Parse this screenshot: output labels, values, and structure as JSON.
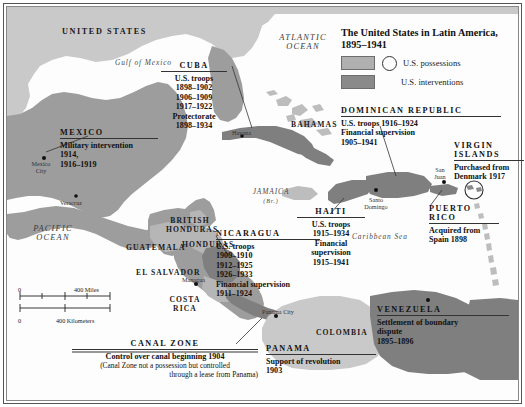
{
  "title": {
    "line1": "The United States in Latin America,",
    "line2": "1895–1941"
  },
  "legend": {
    "possessions": "U.S. possessions",
    "interventions": "U.S. interventions",
    "possessions_color": "#b0b0b0",
    "interventions_color": "#8a8a8a"
  },
  "regions": {
    "united_states": "UNITED STATES",
    "mexico_land": "MEXICO",
    "british_honduras": "BRITISH\nHONDURAS",
    "guatemala": "GUATEMALA",
    "honduras": "HONDURAS",
    "el_salvador": "EL SALVADOR",
    "costa_rica": "COSTA\nRICA",
    "colombia": "COLOMBIA",
    "bahamas": "BAHAMAS",
    "jamaica": "JAMAICA",
    "jamaica_sub": "(Br.)"
  },
  "oceans": {
    "atlantic": "ATLANTIC\nOCEAN",
    "pacific": "PACIFIC\nOCEAN",
    "gulf_of_mexico": "Gulf of Mexico",
    "caribbean_sea": "Caribbean Sea"
  },
  "cities": {
    "mexico_city": "Mexico\nCity",
    "veracruz": "Veracruz",
    "havana": "Havana",
    "managua": "Managua",
    "santo_domingo": "Santo\nDomingo",
    "san_juan": "San\nJuan",
    "panama_city": "Panama City"
  },
  "callouts": {
    "cuba": {
      "head": "CUBA",
      "lines": [
        "U.S. troops",
        "1898–1902",
        "1906–1909",
        "1917–1922",
        "Protectorate",
        "1898–1934"
      ]
    },
    "mexico": {
      "head": "MEXICO",
      "lines": [
        "Military intervention",
        "1914,",
        "1916–1919"
      ]
    },
    "dominican_republic": {
      "head": "DOMINICAN REPUBLIC",
      "lines": [
        "U.S. troops 1916–1924",
        "Financial supervision",
        "1905–1941"
      ]
    },
    "virgin_islands": {
      "head": "VIRGIN\nISLANDS",
      "lines": [
        "Purchased from",
        "Denmark 1917"
      ]
    },
    "puerto_rico": {
      "head": "PUERTO\nRICO",
      "lines": [
        "Acquired from",
        "Spain 1898"
      ]
    },
    "haiti": {
      "head": "HAITI",
      "lines": [
        "U.S. troops",
        "1915–1934",
        "Financial",
        "supervision",
        "1915–1941"
      ]
    },
    "nicaragua": {
      "head": "NICARAGUA",
      "lines": [
        "U.S. troops",
        "1909–1910",
        "1912–1925",
        "1926–1933",
        "Financial supervision",
        "1911–1924"
      ]
    },
    "canal_zone": {
      "head": "CANAL ZONE",
      "lines": [
        "Control over canal beginning 1904"
      ],
      "note": [
        "(Canal Zone not a possession but controlled",
        "through a lease from Panama)"
      ]
    },
    "panama": {
      "head": "PANAMA",
      "lines": [
        "Support of revolution",
        "1903"
      ]
    },
    "venezuela": {
      "head": "VENEZUELA",
      "lines": [
        "Settlement of boundary",
        "dispute",
        "1895–1896"
      ]
    }
  },
  "scale": {
    "miles_zero": "0",
    "miles_label": "400 Miles",
    "km_zero": "0",
    "km_label": "400 Kilometers"
  }
}
